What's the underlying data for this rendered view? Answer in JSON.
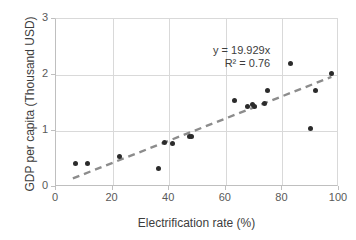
{
  "chart_data": {
    "type": "scatter",
    "title": "",
    "xlabel": "Electrification rate (%)",
    "ylabel": "GDP per capita (Thousand USD)",
    "xlim": [
      0,
      100
    ],
    "ylim": [
      0,
      3
    ],
    "xticks": [
      "0",
      "20",
      "40",
      "60",
      "80",
      "100"
    ],
    "yticks": [
      "0",
      "1",
      "2",
      "3"
    ],
    "grid": true,
    "legend": "none",
    "series": [
      {
        "name": "Countries",
        "marker": "circle",
        "color": "#2b2b2b",
        "points": [
          {
            "x": 6.8,
            "y": 0.42
          },
          {
            "x": 11.2,
            "y": 0.42
          },
          {
            "x": 22.3,
            "y": 0.55
          },
          {
            "x": 36.2,
            "y": 0.33
          },
          {
            "x": 38.3,
            "y": 0.8
          },
          {
            "x": 41.0,
            "y": 0.78
          },
          {
            "x": 47.0,
            "y": 0.9
          },
          {
            "x": 48.0,
            "y": 0.91
          },
          {
            "x": 63.2,
            "y": 1.55
          },
          {
            "x": 67.8,
            "y": 1.43
          },
          {
            "x": 69.5,
            "y": 1.47
          },
          {
            "x": 70.2,
            "y": 1.44
          },
          {
            "x": 73.8,
            "y": 1.49
          },
          {
            "x": 74.6,
            "y": 1.73
          },
          {
            "x": 82.9,
            "y": 2.2
          },
          {
            "x": 89.9,
            "y": 1.05
          },
          {
            "x": 91.8,
            "y": 1.72
          },
          {
            "x": 97.2,
            "y": 2.02
          }
        ]
      }
    ],
    "trendline": {
      "type": "linear",
      "slope": 0.019929,
      "intercept": 0,
      "style": "dashed",
      "color": "#8c8c8c",
      "equation_label": "y = 19.929x",
      "r2_label": "R² = 0.76",
      "x_start": 6.0,
      "x_end": 98.0
    }
  },
  "annotations": {
    "equation": "y = 19.929x",
    "r_squared": "R² = 0.76"
  },
  "colors": {
    "marker": "#2b2b2b",
    "trendline": "#8c8c8c",
    "grid": "#d9d9d9",
    "axis": "#bfbfbf",
    "text": "#3d3d3d",
    "background": "#ffffff"
  }
}
